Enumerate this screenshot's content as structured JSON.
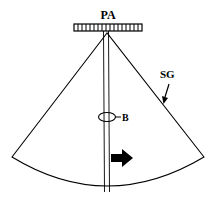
{
  "labels": {
    "transducer": "PA",
    "sector": "SG",
    "bubble": "B"
  },
  "elements": {
    "transducer_array": {
      "segments": 17,
      "icon": "phased-array-transducer"
    },
    "imaging_sector": {
      "shape": "fan-sector"
    },
    "needle": {
      "shape": "parallel-lines"
    },
    "bubble_marker": {
      "shape": "ellipse"
    },
    "direction_arrow": {
      "icon": "arrow-right",
      "color": "#000000"
    },
    "sector_pointer": {
      "icon": "arrow-down-left"
    }
  },
  "colors": {
    "stroke": "#000000",
    "background": "#ffffff"
  }
}
